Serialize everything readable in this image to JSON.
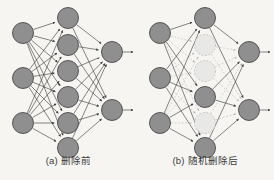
{
  "figure": {
    "background_color": "#f6f5f2"
  },
  "style": {
    "node_active_fill": "#8f8f8f",
    "node_active_stroke": "#4a4a4a",
    "node_dropped_fill": "#e8e8e6",
    "node_dropped_stroke": "#b9b9b7",
    "edge_active_color": "#3c3c3c",
    "edge_dropped_color": "#b5b5b3",
    "caption_color": "#3b3b3b",
    "node_radius": 10.5
  },
  "panels": [
    {
      "id": "a",
      "caption": "(a) 删除前",
      "layers": [
        {
          "name": "input",
          "nodes": [
            {
              "id": "a-i1",
              "cx": 23,
              "cy": 33,
              "state": "active"
            },
            {
              "id": "a-i2",
              "cx": 23,
              "cy": 78,
              "state": "active"
            },
            {
              "id": "a-i3",
              "cx": 23,
              "cy": 123,
              "state": "active"
            }
          ]
        },
        {
          "name": "hidden",
          "nodes": [
            {
              "id": "a-h1",
              "cx": 68,
              "cy": 18,
              "state": "active"
            },
            {
              "id": "a-h2",
              "cx": 68,
              "cy": 45,
              "state": "active"
            },
            {
              "id": "a-h3",
              "cx": 68,
              "cy": 71,
              "state": "active"
            },
            {
              "id": "a-h4",
              "cx": 68,
              "cy": 97,
              "state": "active"
            },
            {
              "id": "a-h5",
              "cx": 68,
              "cy": 123,
              "state": "active"
            },
            {
              "id": "a-h6",
              "cx": 68,
              "cy": 148,
              "state": "active"
            }
          ]
        },
        {
          "name": "output",
          "nodes": [
            {
              "id": "a-o1",
              "cx": 112,
              "cy": 52,
              "state": "active"
            },
            {
              "id": "a-o2",
              "cx": 112,
              "cy": 110,
              "state": "active"
            }
          ]
        }
      ],
      "output_arrows": [
        {
          "from_id": "a-o1",
          "x2": 133,
          "y2": 52
        },
        {
          "from_id": "a-o2",
          "x2": 133,
          "y2": 110
        }
      ]
    },
    {
      "id": "b",
      "caption": "(b) 随机删除后",
      "layers": [
        {
          "name": "input",
          "nodes": [
            {
              "id": "b-i1",
              "cx": 23,
              "cy": 33,
              "state": "active"
            },
            {
              "id": "b-i2",
              "cx": 23,
              "cy": 78,
              "state": "active"
            },
            {
              "id": "b-i3",
              "cx": 23,
              "cy": 123,
              "state": "active"
            }
          ]
        },
        {
          "name": "hidden",
          "nodes": [
            {
              "id": "b-h1",
              "cx": 68,
              "cy": 18,
              "state": "active"
            },
            {
              "id": "b-h2",
              "cx": 68,
              "cy": 45,
              "state": "dropped"
            },
            {
              "id": "b-h3",
              "cx": 68,
              "cy": 71,
              "state": "dropped"
            },
            {
              "id": "b-h4",
              "cx": 68,
              "cy": 97,
              "state": "active"
            },
            {
              "id": "b-h5",
              "cx": 68,
              "cy": 123,
              "state": "dropped"
            },
            {
              "id": "b-h6",
              "cx": 68,
              "cy": 148,
              "state": "active"
            }
          ]
        },
        {
          "name": "output",
          "nodes": [
            {
              "id": "b-o1",
              "cx": 112,
              "cy": 52,
              "state": "active"
            },
            {
              "id": "b-o2",
              "cx": 112,
              "cy": 110,
              "state": "active"
            }
          ]
        }
      ],
      "output_arrows": [
        {
          "from_id": "b-o1",
          "x2": 133,
          "y2": 52
        },
        {
          "from_id": "b-o2",
          "x2": 133,
          "y2": 110
        }
      ]
    }
  ]
}
